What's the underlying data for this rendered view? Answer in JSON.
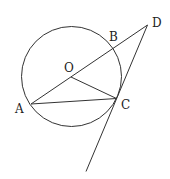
{
  "diagram": {
    "circle": {
      "center": "O",
      "cx": 71.5,
      "cy": 76.5,
      "r": 50
    },
    "points": {
      "O": {
        "label": "O",
        "x": 71,
        "y": 77,
        "lx": 64,
        "ly": 72
      },
      "A": {
        "label": "A",
        "x": 31,
        "y": 104,
        "lx": 15,
        "ly": 113
      },
      "B": {
        "label": "B",
        "x": 112.5,
        "y": 49,
        "lx": 109,
        "ly": 41
      },
      "C": {
        "label": "C",
        "x": 116.5,
        "y": 98.5,
        "lx": 121,
        "ly": 109
      },
      "D": {
        "label": "D",
        "x": 147.5,
        "y": 25,
        "lx": 152,
        "ly": 27
      }
    },
    "segments": [
      [
        "A",
        "D"
      ],
      [
        "A",
        "C"
      ],
      [
        "O",
        "C"
      ]
    ],
    "tangent_line": {
      "from": "D",
      "through": "C",
      "end_x": 86,
      "end_y": 171.5
    }
  }
}
